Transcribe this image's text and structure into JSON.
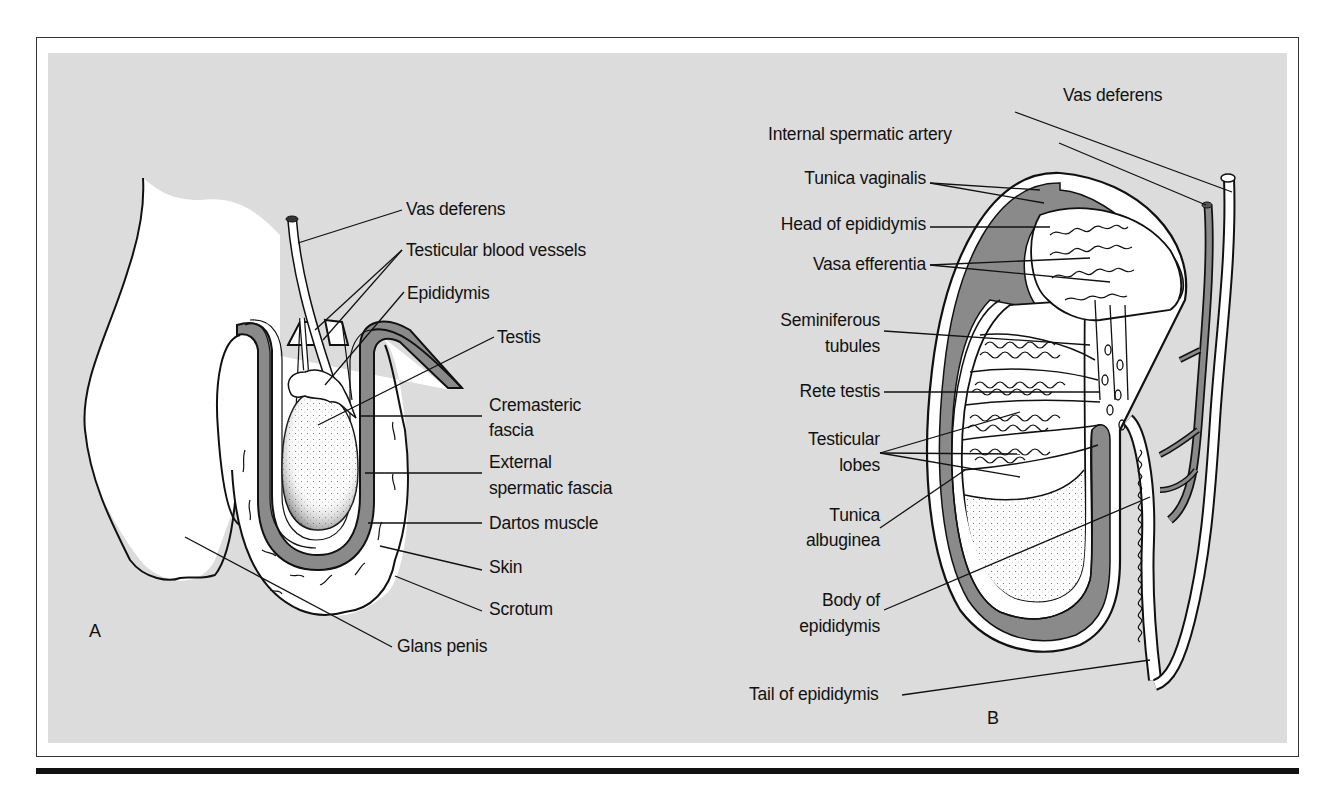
{
  "figure": {
    "panel_a": {
      "letter": "A",
      "labels": {
        "vas_deferens": "Vas deferens",
        "testicular_blood_vessels": "Testicular blood vessels",
        "epididymis": "Epididymis",
        "testis": "Testis",
        "cremasteric_fascia_1": "Cremasteric",
        "cremasteric_fascia_2": "fascia",
        "external_spermatic_fascia_1": "External",
        "external_spermatic_fascia_2": "spermatic fascia",
        "dartos_muscle": "Dartos muscle",
        "skin": "Skin",
        "scrotum": "Scrotum",
        "glans_penis": "Glans penis"
      }
    },
    "panel_b": {
      "letter": "B",
      "labels": {
        "vas_deferens": "Vas deferens",
        "internal_spermatic_artery": "Internal spermatic artery",
        "tunica_vaginalis": "Tunica vaginalis",
        "head_of_epididymis": "Head of epididymis",
        "vasa_efferentia": "Vasa efferentia",
        "seminiferous_tubules_1": "Seminiferous",
        "seminiferous_tubules_2": "tubules",
        "rete_testis": "Rete testis",
        "testicular_lobes_1": "Testicular",
        "testicular_lobes_2": "lobes",
        "tunica_albuginea_1": "Tunica",
        "tunica_albuginea_2": "albuginea",
        "body_of_epididymis_1": "Body of",
        "body_of_epididymis_2": "epididymis",
        "tail_of_epididymis": "Tail of epididymis"
      }
    },
    "colors": {
      "panel_background": "#dcdcdc",
      "tissue_dark": "#8a8a8a",
      "outline": "#111111",
      "tissue_light": "#ffffff"
    }
  }
}
